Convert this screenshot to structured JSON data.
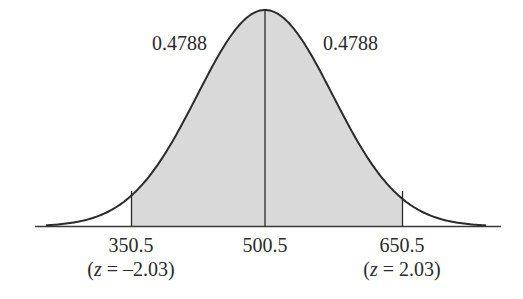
{
  "chart_data": {
    "type": "area",
    "title": "",
    "mean": 500.5,
    "shaded_region": {
      "from": 350.5,
      "to": 650.5
    },
    "areas": [
      {
        "from": 350.5,
        "to": 500.5,
        "value": 0.4788,
        "label": "0.4788"
      },
      {
        "from": 500.5,
        "to": 650.5,
        "value": 0.4788,
        "label": "0.4788"
      }
    ],
    "x_ticks": [
      {
        "value": 350.5,
        "label": "350.5",
        "z_label": "(z = –2.03)",
        "z": -2.03
      },
      {
        "value": 500.5,
        "label": "500.5"
      },
      {
        "value": 650.5,
        "label": "650.5",
        "z_label": "(z = 2.03)",
        "z": 2.03
      }
    ],
    "xlabel": "",
    "ylabel": "",
    "grid": false,
    "legend": null
  },
  "labels": {
    "area_left": "0.4788",
    "area_right": "0.4788",
    "tick_left": "350.5",
    "tick_mid": "500.5",
    "tick_right": "650.5",
    "z_left_open": "(",
    "z_left_var": "z",
    "z_left_rest": " = –2.03)",
    "z_right_open": "(",
    "z_right_var": "z",
    "z_right_rest": " = 2.03)"
  },
  "colors": {
    "shade": "#d9d9d9",
    "curve": "#2b2b2b",
    "axis": "#3a3a3a"
  }
}
